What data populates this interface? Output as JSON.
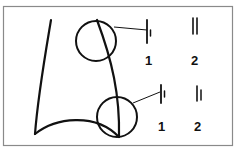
{
  "diagram": {
    "colors": {
      "stroke": "#111111",
      "frame": "#8a8a8a",
      "background": "#ffffff"
    },
    "upper_detail": {
      "labels": [
        "1",
        "2"
      ]
    },
    "lower_detail": {
      "labels": [
        "1",
        "2"
      ]
    }
  }
}
